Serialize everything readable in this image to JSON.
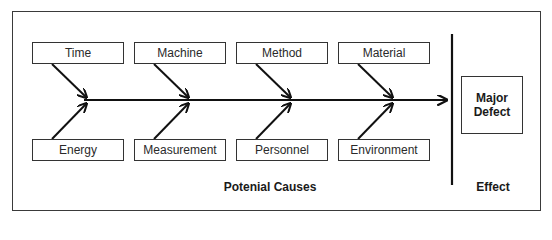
{
  "diagram": {
    "type": "fishbone",
    "causes_top": [
      "Time",
      "Machine",
      "Method",
      "Material"
    ],
    "causes_bottom": [
      "Energy",
      "Measurement",
      "Personnel",
      "Environment"
    ],
    "effect_lines": [
      "Major",
      "Defect"
    ],
    "causes_caption": "Potenial Causes",
    "effect_caption": "Effect"
  }
}
